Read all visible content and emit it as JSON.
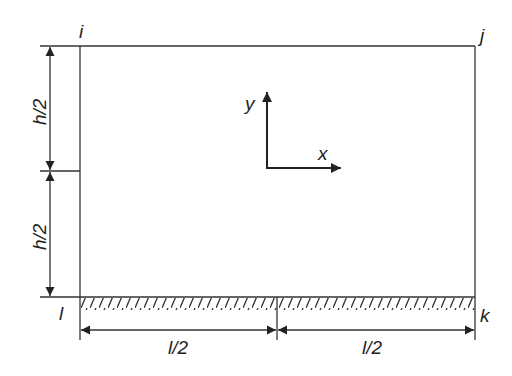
{
  "diagram": {
    "nodes": {
      "i": "i",
      "j": "j",
      "k": "k",
      "l": "l"
    },
    "dimensions": {
      "upper_height": "h/2",
      "lower_height": "h/2",
      "left_width": "l/2",
      "right_width": "l/2"
    },
    "axes": {
      "x": "x",
      "y": "y"
    },
    "colors": {
      "line": "#333333",
      "background": "#ffffff"
    }
  }
}
